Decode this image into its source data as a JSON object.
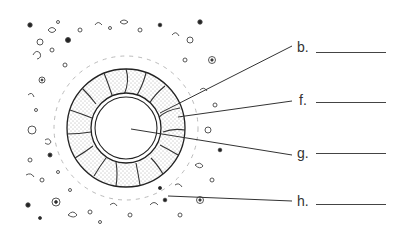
{
  "diagram": {
    "type": "labeled cross-section worksheet",
    "structures": [
      "speckled background tissue with scattered cells",
      "outer dashed halo ring",
      "stippled thick ring with branching channels",
      "double-walled inner circle",
      "empty central lumen"
    ],
    "colors": {
      "ink": "#333333",
      "background": "#ffffff",
      "stipple": "#777777"
    }
  },
  "labels": [
    {
      "letter": "b.",
      "answer": ""
    },
    {
      "letter": "f.",
      "answer": ""
    },
    {
      "letter": "g.",
      "answer": ""
    },
    {
      "letter": "h.",
      "answer": ""
    }
  ]
}
